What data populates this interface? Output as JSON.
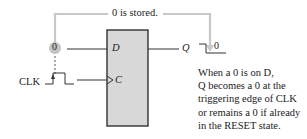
{
  "diagram": {
    "type": "D flip-flop timing illustration",
    "callout_label": "0 is stored.",
    "input_value": "0",
    "output_value": "0",
    "flipflop": {
      "inputs": [
        {
          "label": "D",
          "signal": "0"
        },
        {
          "label": "C",
          "signal": "CLK",
          "clock_edge_marker": ">"
        }
      ],
      "outputs": [
        {
          "label": "Q"
        }
      ]
    },
    "clock_label": "CLK",
    "description_lines": [
      "When a 0 is on D,",
      "Q becomes a 0 at the",
      "triggering edge of CLK",
      "or remains a 0 if already",
      "in the RESET state."
    ],
    "colors": {
      "box_fill": "#d8d8d8",
      "box_stroke": "#333333",
      "callout_line": "#c8c8c8",
      "wire": "#333333",
      "input_circle": "#c0c0c0"
    }
  }
}
